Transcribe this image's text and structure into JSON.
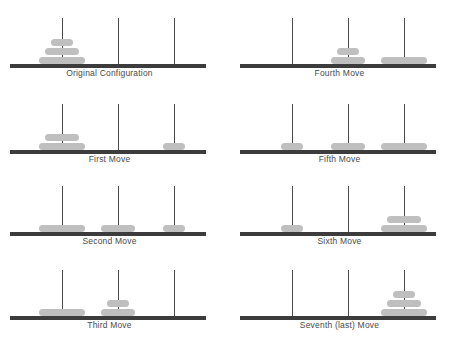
{
  "figure": {
    "colors": {
      "disk": "#bfbfbf",
      "peg": "#4a4a4a",
      "base": "#3c3c3c",
      "caption": "#4a4a4a",
      "background": "#ffffff"
    },
    "disk_sizes": {
      "small": 22,
      "medium": 34,
      "large": 46
    },
    "peg_positions": [
      52,
      108,
      164
    ],
    "peg_heights": [
      46,
      46,
      46
    ]
  },
  "panels": [
    {
      "id": "original-configuration",
      "caption": "Original Configuration",
      "column": "left",
      "row": 0,
      "pegs": [
        [
          "large",
          "medium",
          "small"
        ],
        [],
        []
      ]
    },
    {
      "id": "fourth-move",
      "caption": "Fourth Move",
      "column": "right",
      "row": 0,
      "pegs": [
        [],
        [
          "medium",
          "small"
        ],
        [
          "large"
        ]
      ]
    },
    {
      "id": "first-move",
      "caption": "First Move",
      "column": "left",
      "row": 1,
      "pegs": [
        [
          "large",
          "medium"
        ],
        [],
        [
          "small"
        ]
      ]
    },
    {
      "id": "fifth-move",
      "caption": "Fifth Move",
      "column": "right",
      "row": 1,
      "pegs": [
        [
          "small"
        ],
        [
          "medium"
        ],
        [
          "large"
        ]
      ]
    },
    {
      "id": "second-move",
      "caption": "Second Move",
      "column": "left",
      "row": 2,
      "pegs": [
        [
          "large"
        ],
        [
          "medium"
        ],
        [
          "small"
        ]
      ]
    },
    {
      "id": "sixth-move",
      "caption": "Sixth Move",
      "column": "right",
      "row": 2,
      "pegs": [
        [
          "small"
        ],
        [],
        [
          "large",
          "medium"
        ]
      ]
    },
    {
      "id": "third-move",
      "caption": "Third Move",
      "column": "left",
      "row": 3,
      "pegs": [
        [
          "large"
        ],
        [
          "medium",
          "small"
        ],
        []
      ]
    },
    {
      "id": "seventh-last-move",
      "caption": "Seventh (last) Move",
      "column": "right",
      "row": 3,
      "pegs": [
        [],
        [],
        [
          "large",
          "medium",
          "small"
        ]
      ]
    }
  ]
}
